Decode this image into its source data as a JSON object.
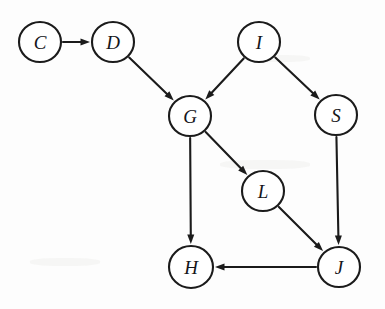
{
  "figure": {
    "name": "directed-graph",
    "type": "directed-graph",
    "width": 385,
    "height": 309,
    "background_color": "#fdfdfd",
    "stroke_color": "#1b1b1b",
    "node_fill_color": "#ffffff",
    "label_color": "#15151a"
  },
  "graph_data": {
    "type": "diagram",
    "directed": true,
    "node_count": 8,
    "edge_count": 8,
    "nodes": [
      {
        "id": "C",
        "label": "C",
        "cx": 40,
        "cy": 42,
        "rx": 21,
        "ry": 20
      },
      {
        "id": "D",
        "label": "D",
        "cx": 113,
        "cy": 42,
        "rx": 21,
        "ry": 20
      },
      {
        "id": "I",
        "label": "I",
        "cx": 259,
        "cy": 42,
        "rx": 21,
        "ry": 20
      },
      {
        "id": "G",
        "label": "G",
        "cx": 190,
        "cy": 116,
        "rx": 21,
        "ry": 20
      },
      {
        "id": "S",
        "label": "S",
        "cx": 336,
        "cy": 115,
        "rx": 21,
        "ry": 20
      },
      {
        "id": "L",
        "label": "L",
        "cx": 263,
        "cy": 191,
        "rx": 21,
        "ry": 20
      },
      {
        "id": "H",
        "label": "H",
        "cx": 191,
        "cy": 267,
        "rx": 22,
        "ry": 21
      },
      {
        "id": "J",
        "label": "J",
        "cx": 339,
        "cy": 267,
        "rx": 21,
        "ry": 20
      }
    ],
    "edges": [
      {
        "from": "C",
        "to": "D"
      },
      {
        "from": "D",
        "to": "G"
      },
      {
        "from": "I",
        "to": "G"
      },
      {
        "from": "I",
        "to": "S"
      },
      {
        "from": "G",
        "to": "L"
      },
      {
        "from": "G",
        "to": "H"
      },
      {
        "from": "S",
        "to": "J"
      },
      {
        "from": "L",
        "to": "J"
      },
      {
        "from": "J",
        "to": "H"
      }
    ]
  }
}
